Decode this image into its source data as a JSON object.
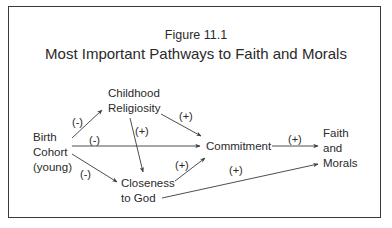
{
  "figure": {
    "number": "Figure 11.1",
    "title": "Most Important Pathways to Faith and Morals"
  },
  "nodes": {
    "birth_cohort": {
      "line1": "Birth",
      "line2": "Cohort",
      "line3": "(young)"
    },
    "childhood_religiosity": {
      "line1": "Childhood",
      "line2": "Religiosity"
    },
    "closeness_to_god": {
      "line1": "Closeness",
      "line2": "to God"
    },
    "commitment": {
      "line1": "Commitment"
    },
    "faith_and_morals": {
      "line1": "Faith",
      "line2": "and",
      "line3": "Morals"
    }
  },
  "edges": [
    {
      "from": "Birth Cohort (young)",
      "to": "Childhood Religiosity",
      "sign": "(-)"
    },
    {
      "from": "Birth Cohort (young)",
      "to": "Commitment",
      "sign": "(-)"
    },
    {
      "from": "Birth Cohort (young)",
      "to": "Closeness to God",
      "sign": "(-)"
    },
    {
      "from": "Childhood Religiosity",
      "to": "Commitment",
      "sign": "(+)"
    },
    {
      "from": "Childhood Religiosity",
      "to": "Closeness to God",
      "sign": "(+)"
    },
    {
      "from": "Closeness to God",
      "to": "Commitment",
      "sign": "(+)"
    },
    {
      "from": "Commitment",
      "to": "Faith and Morals",
      "sign": "(+)"
    },
    {
      "from": "Closeness to God",
      "to": "Faith and Morals",
      "sign": "(+)"
    }
  ],
  "colors": {
    "line": "#3a3a3a",
    "text": "#2a2a2a",
    "border": "#3a3a3a"
  }
}
